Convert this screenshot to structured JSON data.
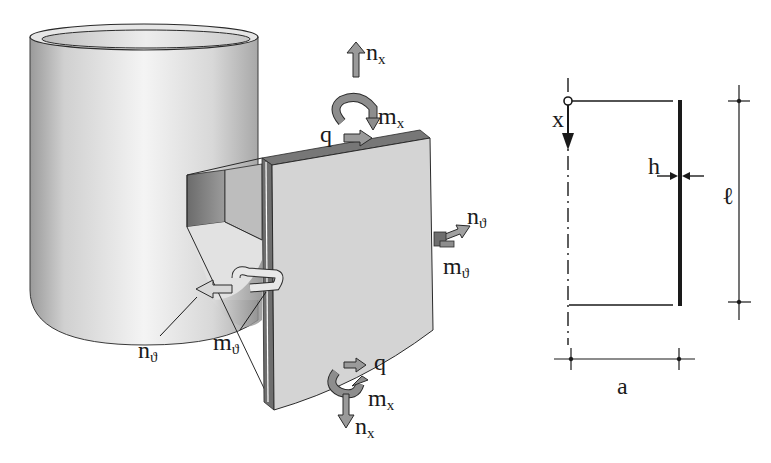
{
  "figure": {
    "left_view": {
      "description": "3D cylindrical shell with cut-out element showing stress resultants",
      "labels": {
        "nx_top": {
          "base": "n",
          "sub": "x"
        },
        "mx_top": {
          "base": "m",
          "sub": "x"
        },
        "q_top": "q",
        "ntheta_right": {
          "base": "n",
          "sub": "ϑ"
        },
        "mtheta_right": {
          "base": "m",
          "sub": "ϑ"
        },
        "ntheta_left": {
          "base": "n",
          "sub": "ϑ"
        },
        "mtheta_left": {
          "base": "m",
          "sub": "ϑ"
        },
        "q_bottom": "q",
        "mx_bottom": {
          "base": "m",
          "sub": "x"
        },
        "nx_bottom": {
          "base": "n",
          "sub": "x"
        }
      }
    },
    "right_view": {
      "description": "Cross-section of cylindrical shell with dimensions",
      "labels": {
        "axis": "x",
        "thickness": "h",
        "length": "ℓ",
        "radius": "a"
      }
    },
    "colors": {
      "line": "#1a1a1a",
      "cylinder_light": "#f2f2f2",
      "cylinder_dark": "#8c8c8c",
      "plate_face": "#d4d4d4",
      "plate_edge": "#6e6e6e",
      "arrow_fill": "#9a9a9a"
    }
  }
}
